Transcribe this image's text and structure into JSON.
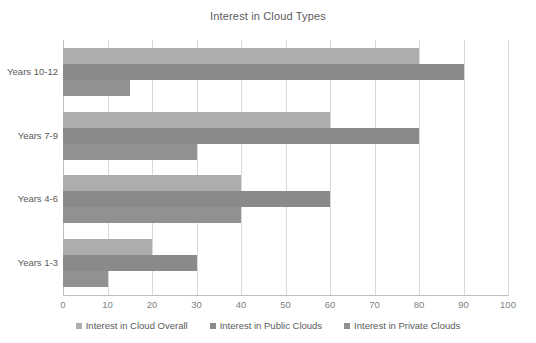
{
  "chart_data": {
    "type": "bar",
    "orientation": "horizontal",
    "title": "Interest in Cloud Types",
    "xlabel": "",
    "ylabel": "",
    "xlim": [
      0,
      100
    ],
    "xticks": [
      0,
      10,
      20,
      30,
      40,
      50,
      60,
      70,
      80,
      90,
      100
    ],
    "grid": true,
    "legend_position": "bottom",
    "categories": [
      "Years 1-3",
      "Years 4-6",
      "Years 7-9",
      "Years 10-12"
    ],
    "categories_top_to_bottom": [
      "Years 10-12",
      "Years 7-9",
      "Years 4-6",
      "Years 1-3"
    ],
    "series": [
      {
        "name": "Interest in Cloud Overall",
        "color": "#adadad",
        "values": [
          20,
          40,
          60,
          80
        ]
      },
      {
        "name": "Interest in Public Clouds",
        "color": "#8a8a8a",
        "values": [
          30,
          60,
          80,
          90
        ]
      },
      {
        "name": "Interest in Private Clouds",
        "color": "#919191",
        "values": [
          10,
          40,
          30,
          15
        ]
      }
    ]
  },
  "colors": {
    "background": "#ffffff",
    "text": "#5a5a5a",
    "gridline": "#d9d9d9",
    "axis": "#bfbfbf"
  }
}
